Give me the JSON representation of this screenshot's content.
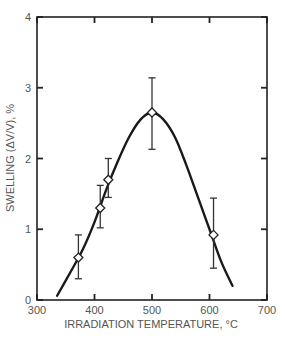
{
  "chart_data": {
    "type": "scatter",
    "title": "",
    "xlabel": "IRRADIATION TEMPERATURE, °C",
    "ylabel": "SWELLING (ΔV/V), %",
    "xlim": [
      300,
      700
    ],
    "ylim": [
      0,
      4
    ],
    "x_ticks": [
      "300",
      "400",
      "500",
      "600",
      "700"
    ],
    "y_ticks": [
      "0",
      "1",
      "2",
      "3",
      "4"
    ],
    "grid": false,
    "legend": null,
    "series": [
      {
        "name": "Measured swelling",
        "marker": "open-diamond",
        "points": [
          {
            "x": 372,
            "y": 0.6,
            "err_low": 0.3,
            "err_high": 0.92
          },
          {
            "x": 410,
            "y": 1.3,
            "err_low": 1.02,
            "err_high": 1.62
          },
          {
            "x": 424,
            "y": 1.7,
            "err_low": 1.45,
            "err_high": 2.0
          },
          {
            "x": 500,
            "y": 2.65,
            "err_low": 2.13,
            "err_high": 3.14
          },
          {
            "x": 607,
            "y": 0.92,
            "err_low": 0.45,
            "err_high": 1.44
          }
        ]
      },
      {
        "name": "Fitted curve",
        "type": "line",
        "x": [
          335,
          360,
          380,
          400,
          420,
          440,
          460,
          480,
          500,
          520,
          540,
          560,
          580,
          600,
          620,
          640
        ],
        "y": [
          0.06,
          0.42,
          0.72,
          1.1,
          1.55,
          1.95,
          2.3,
          2.55,
          2.65,
          2.55,
          2.3,
          1.9,
          1.45,
          1.0,
          0.55,
          0.2
        ]
      }
    ]
  }
}
